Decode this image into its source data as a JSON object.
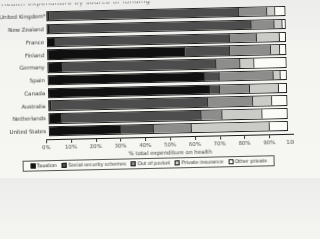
{
  "title_fragment": "Health expenditure by source of funding",
  "chart_data": {
    "type": "bar",
    "orientation": "horizontal-stacked",
    "xlabel": "% total expenditure on health",
    "xlim": [
      0,
      100
    ],
    "grid": false,
    "legend_position": "bottom",
    "x_ticks": [
      "0%",
      "10%",
      "20%",
      "30%",
      "40%",
      "50%",
      "60%",
      "70%",
      "80%",
      "90%",
      "100%"
    ],
    "legend": [
      {
        "label": "Taxation",
        "color": "#101010"
      },
      {
        "label": "Social security schemes",
        "color": "#4d4d4d"
      },
      {
        "label": "Out of pocket",
        "color": "#8d8d8b"
      },
      {
        "label": "Private insurance",
        "color": "#cbcbc7"
      },
      {
        "label": "Other private",
        "color": "#fbfbf8"
      }
    ],
    "categories": [
      "United Kingdom*",
      "New Zealand",
      "France",
      "Finland",
      "Germany",
      "Spain",
      "Canada",
      "Australia",
      "Netherlands",
      "United States"
    ],
    "series": [
      {
        "name": "Taxation",
        "values": [
          1,
          1,
          3,
          58,
          6,
          66,
          68,
          1,
          5,
          30
        ]
      },
      {
        "name": "Social security schemes",
        "values": [
          80,
          85,
          74,
          19,
          65,
          6,
          4,
          66,
          59,
          14
        ]
      },
      {
        "name": "Out of pocket",
        "values": [
          12,
          10,
          11,
          17,
          10,
          23,
          13,
          19,
          9,
          16
        ]
      },
      {
        "name": "Private insurance",
        "values": [
          3,
          3,
          10,
          4,
          6,
          3,
          12,
          8,
          17,
          33
        ]
      },
      {
        "name": "Other private",
        "values": [
          4,
          1,
          2,
          2,
          13,
          2,
          3,
          6,
          10,
          7
        ]
      }
    ]
  }
}
